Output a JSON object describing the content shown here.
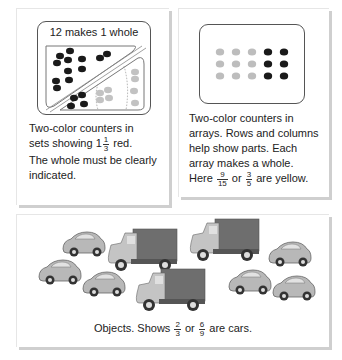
{
  "panels": [
    {
      "id": "sets",
      "frame_label": "12 makes 1 whole",
      "caption": {
        "line1": "Two-color counters in",
        "line2_pre": "sets showing ",
        "mixed_whole": "1",
        "fraction": {
          "numerator": "1",
          "denominator": "3"
        },
        "line2_post": " red.",
        "line3": "The whole must be clearly",
        "line4": "indicated."
      },
      "counters": {
        "dark_count": 16,
        "light_count": 8,
        "dark_color": "#1a1a1a",
        "light_color": "#bdbdbd"
      }
    },
    {
      "id": "arrays",
      "array": {
        "rows": 3,
        "columns": 5,
        "light_columns": 3,
        "dark_columns": 2,
        "light_color": "#bdbdbd",
        "dark_color": "#1a1a1a"
      },
      "caption": {
        "line1": "Two-color counters in",
        "line2": "arrays. Rows and columns",
        "line3": "help show parts. Each",
        "line4": "array makes a whole.",
        "line5_pre": "Here ",
        "fraction1": {
          "numerator": "9",
          "denominator": "15"
        },
        "or": " or ",
        "fraction2": {
          "numerator": "3",
          "denominator": "5"
        },
        "line5_post": " are yellow."
      }
    },
    {
      "id": "objects",
      "objects": {
        "cars": 6,
        "trucks": 3
      },
      "caption": {
        "pre": "Objects. Shows ",
        "fraction1": {
          "numerator": "2",
          "denominator": "3"
        },
        "or": " or ",
        "fraction2": {
          "numerator": "6",
          "denominator": "9"
        },
        "post": " are cars."
      }
    }
  ],
  "colors": {
    "frame": "#555555",
    "shadow": "#cfcfcf",
    "car_body": "#b8b8b8",
    "truck_box": "#6e6e6e",
    "truck_cab": "#c4c4c4"
  }
}
